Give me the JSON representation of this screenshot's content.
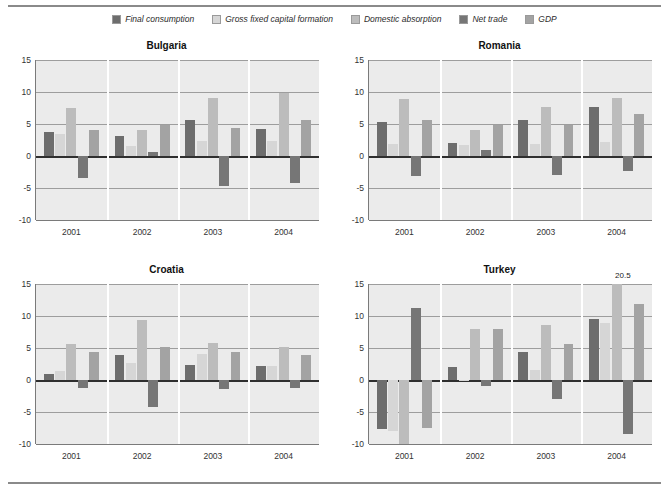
{
  "figure": {
    "legend_position": "top-center",
    "series_colors": {
      "Final consumption": "#6d6d6d",
      "Gross fixed capital formation": "#d6d6d6",
      "Domestic absorption": "#bcbcbc",
      "Net trade": "#767676",
      "GDP": "#a3a3a3"
    },
    "plot_background": "#ebebeb",
    "gridline_color": "#9d9d9d",
    "zero_line_color": "#2f2f2f"
  },
  "legend": {
    "items": [
      {
        "label": "Final consumption",
        "color": "#6d6d6d"
      },
      {
        "label": "Gross fixed capital formation",
        "color": "#d6d6d6"
      },
      {
        "label": "Domestic absorption",
        "color": "#bcbcbc"
      },
      {
        "label": "Net trade",
        "color": "#767676"
      },
      {
        "label": "GDP",
        "color": "#a3a3a3"
      }
    ]
  },
  "chart_data": [
    {
      "type": "bar",
      "title": "Bulgaria",
      "xlabel": "",
      "ylabel": "",
      "categories": [
        "2001",
        "2002",
        "2003",
        "2004"
      ],
      "ylim": [
        -10,
        15
      ],
      "yticks": [
        15,
        10,
        5,
        0,
        -5,
        -10
      ],
      "grid": true,
      "legend_position": "figure-top",
      "series": [
        {
          "name": "Final consumption",
          "values": [
            3.8,
            3.1,
            5.7,
            4.2
          ]
        },
        {
          "name": "Gross fixed capital formation",
          "values": [
            3.5,
            1.5,
            2.4,
            2.3
          ]
        },
        {
          "name": "Domestic absorption",
          "values": [
            7.5,
            4.1,
            9.0,
            9.8
          ]
        },
        {
          "name": "Net trade",
          "values": [
            -3.5,
            0.7,
            -4.7,
            -4.2
          ]
        },
        {
          "name": "GDP",
          "values": [
            4.0,
            4.9,
            4.3,
            5.6
          ]
        }
      ],
      "annotations": []
    },
    {
      "type": "bar",
      "title": "Romania",
      "xlabel": "",
      "ylabel": "",
      "categories": [
        "2001",
        "2002",
        "2003",
        "2004"
      ],
      "ylim": [
        -10,
        15
      ],
      "yticks": [
        15,
        10,
        5,
        0,
        -5,
        -10
      ],
      "grid": true,
      "legend_position": "figure-top",
      "series": [
        {
          "name": "Final consumption",
          "values": [
            5.3,
            2.0,
            5.6,
            7.6
          ]
        },
        {
          "name": "Gross fixed capital formation",
          "values": [
            1.9,
            1.7,
            1.9,
            2.2
          ]
        },
        {
          "name": "Domestic absorption",
          "values": [
            8.9,
            4.0,
            7.7,
            9.1
          ]
        },
        {
          "name": "Net trade",
          "values": [
            -3.2,
            0.9,
            -2.9,
            -2.4
          ]
        },
        {
          "name": "GDP",
          "values": [
            5.7,
            4.9,
            4.9,
            6.6
          ]
        }
      ],
      "annotations": []
    },
    {
      "type": "bar",
      "title": "Croatia",
      "xlabel": "",
      "ylabel": "",
      "categories": [
        "2001",
        "2002",
        "2003",
        "2004"
      ],
      "ylim": [
        -10,
        15
      ],
      "yticks": [
        15,
        10,
        5,
        0,
        -5,
        -10
      ],
      "grid": true,
      "legend_position": "figure-top",
      "series": [
        {
          "name": "Final consumption",
          "values": [
            0.9,
            3.9,
            2.3,
            2.2
          ]
        },
        {
          "name": "Gross fixed capital formation",
          "values": [
            1.4,
            2.6,
            4.1,
            2.2
          ]
        },
        {
          "name": "Domestic absorption",
          "values": [
            5.7,
            9.4,
            5.8,
            5.2
          ]
        },
        {
          "name": "Net trade",
          "values": [
            -1.3,
            -4.2,
            -1.4,
            -1.3
          ]
        },
        {
          "name": "GDP",
          "values": [
            4.4,
            5.2,
            4.3,
            3.9
          ]
        }
      ],
      "annotations": []
    },
    {
      "type": "bar",
      "title": "Turkey",
      "xlabel": "",
      "ylabel": "",
      "categories": [
        "2001",
        "2002",
        "2003",
        "2004"
      ],
      "ylim": [
        -10,
        15
      ],
      "yticks": [
        15,
        10,
        5,
        0,
        -5,
        -10
      ],
      "grid": true,
      "legend_position": "figure-top",
      "series": [
        {
          "name": "Final consumption",
          "values": [
            -7.6,
            2.0,
            4.3,
            9.6
          ]
        },
        {
          "name": "Gross fixed capital formation",
          "values": [
            -8.0,
            -0.2,
            1.6,
            8.9
          ]
        },
        {
          "name": "Domestic absorption",
          "values": [
            -18.8,
            8.0,
            8.6,
            20.5
          ]
        },
        {
          "name": "Net trade",
          "values": [
            11.2,
            -0.9,
            -3.0,
            -8.5
          ]
        },
        {
          "name": "GDP",
          "values": [
            -7.5,
            7.9,
            5.7,
            11.9
          ]
        }
      ],
      "annotations": [
        {
          "text": "-18.8",
          "category": "2001",
          "series": "Domestic absorption",
          "placement": "below-clip"
        },
        {
          "text": "20.5",
          "category": "2004",
          "series": "Domestic absorption",
          "placement": "above-clip"
        }
      ]
    }
  ]
}
